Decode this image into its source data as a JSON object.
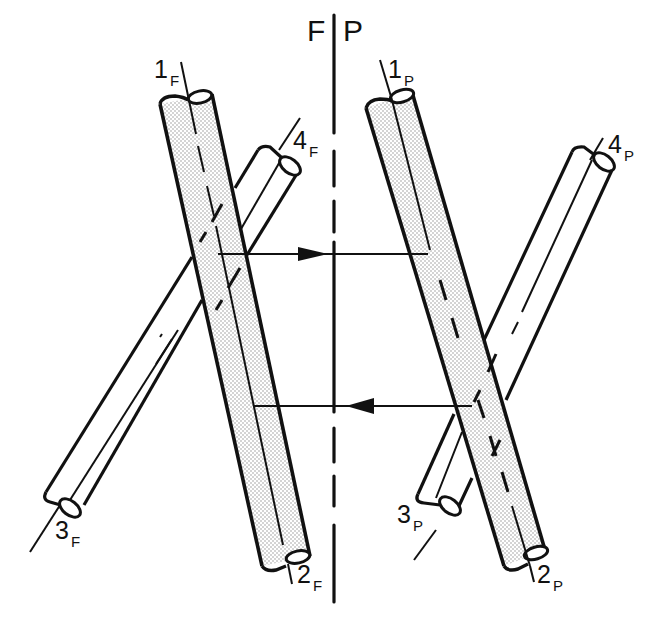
{
  "diagram": {
    "type": "descriptive-geometry line-intersection test (frontal/profile views)",
    "reference_line": {
      "left_label": "F",
      "right_label": "P"
    },
    "labels": {
      "front": {
        "l1": {
          "num": "1",
          "sub": "F"
        },
        "l2": {
          "num": "2",
          "sub": "F"
        },
        "l3": {
          "num": "3",
          "sub": "F"
        },
        "l4": {
          "num": "4",
          "sub": "F"
        }
      },
      "profile": {
        "l1": {
          "num": "1",
          "sub": "P"
        },
        "l2": {
          "num": "2",
          "sub": "P"
        },
        "l3": {
          "num": "3",
          "sub": "P"
        },
        "l4": {
          "num": "4",
          "sub": "P"
        }
      }
    },
    "elements": {
      "front_view": [
        "shaded rod 1F-2F (front)",
        "white rod 3F-4F (behind, hidden parts dashed)"
      ],
      "profile_view": [
        "shaded rod 1P-2P (front)",
        "white rod 3P-4P (behind, hidden parts dashed)"
      ],
      "projectors": [
        {
          "direction": "right",
          "from": "F view",
          "to": "P view",
          "y": 254
        },
        {
          "direction": "left",
          "from": "P view",
          "to": "F view",
          "y": 406
        }
      ]
    },
    "colors": {
      "ink": "#111111",
      "shading": "#d9d9d9",
      "background": "#ffffff"
    }
  }
}
